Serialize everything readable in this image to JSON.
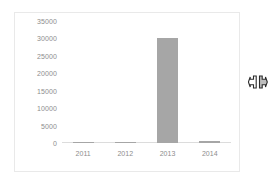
{
  "chart_data": {
    "type": "bar",
    "title": "",
    "subtitle": "",
    "xlabel": "",
    "ylabel": "",
    "categories": [
      "2011",
      "2012",
      "2013",
      "2014"
    ],
    "values": [
      200,
      100,
      30000,
      700
    ],
    "ylim": [
      0,
      35000
    ],
    "yticks": [
      0,
      5000,
      10000,
      15000,
      20000,
      25000,
      30000,
      35000
    ],
    "ytick_labels": [
      "0",
      "5000",
      "10000",
      "15000",
      "20000",
      "25000",
      "30000",
      "35000"
    ],
    "grid": false,
    "legend": null,
    "legend_position": "none",
    "series": [
      {
        "name": "",
        "values": [
          200,
          100,
          30000,
          700
        ]
      }
    ],
    "bar_color": "#a6a6a6",
    "axis_label_color": "#8d8d8d",
    "background_color": "#ffffff",
    "frame_color": "#e9e9e9"
  },
  "cursor": {
    "icon": "horizontal-resize-cursor",
    "x": 258,
    "y": 82
  }
}
